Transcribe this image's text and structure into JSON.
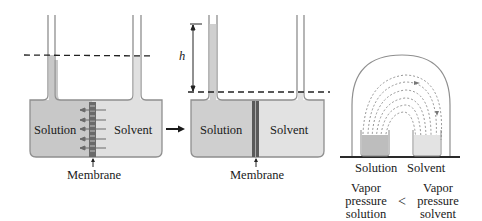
{
  "diagram": {
    "panel_initial": {
      "left_label": "Solution",
      "right_label": "Solvent",
      "membrane_label": "Membrane",
      "solution_fill": "#c9c9c9",
      "solvent_fill": "#e2e2e2"
    },
    "transition_arrow": "arrow-right",
    "panel_equilibrium": {
      "left_label": "Solution",
      "right_label": "Solvent",
      "membrane_label": "Membrane",
      "height_label": "h"
    },
    "panel_bell_jar": {
      "left_label": "Solution",
      "right_label": "Solvent",
      "comparison": {
        "left": [
          "Vapor",
          "pressure",
          "solution"
        ],
        "operator": "<",
        "right": [
          "Vapor",
          "pressure",
          "solvent"
        ]
      }
    },
    "colors": {
      "outline": "#8a8a8a",
      "solution": "#c4c4c4",
      "solvent": "#e4e4e4",
      "membrane": "#555555",
      "dash": "#222222"
    }
  }
}
